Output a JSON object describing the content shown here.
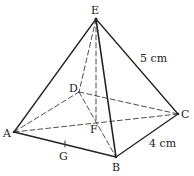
{
  "figure": {
    "type": "square pyramid",
    "vertices": {
      "E": {
        "label": "E",
        "x": 96,
        "y": 19
      },
      "A": {
        "label": "A",
        "x": 14,
        "y": 132
      },
      "B": {
        "label": "B",
        "x": 116,
        "y": 157
      },
      "C": {
        "label": "C",
        "x": 178,
        "y": 114
      },
      "D": {
        "label": "D",
        "x": 79,
        "y": 92
      },
      "F": {
        "label": "F",
        "x": 96,
        "y": 118
      },
      "G": {
        "label": "G",
        "x": 65,
        "y": 145
      }
    },
    "measurements": {
      "slant_edge": "5 cm",
      "base_edge": "4 cm"
    },
    "colors": {
      "line": "#222222",
      "background": "#ffffff"
    }
  }
}
